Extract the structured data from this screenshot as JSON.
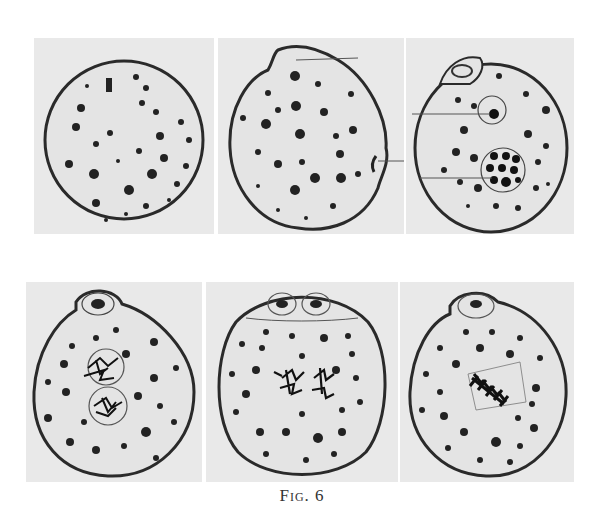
{
  "figure": {
    "caption": "Fig. 6",
    "rows": [
      {
        "panels": [
          {
            "id": "a",
            "description": "Round cell with scattered chromatin granules"
          },
          {
            "id": "b",
            "description": "Cell with protrusion and lateral indentation; two pointer lines"
          },
          {
            "id": "c",
            "description": "Cell with polar bud, nucleolus circle and granular vacuole; two pointer lines"
          }
        ]
      },
      {
        "panels": [
          {
            "id": "d",
            "description": "Cell with bud and two nuclei containing tangled chromatin"
          },
          {
            "id": "e",
            "description": "Cell with two polar bodies and paired chromatin masses"
          },
          {
            "id": "f",
            "description": "Cell with polar bud and metaphase chromosome plate"
          }
        ]
      }
    ]
  }
}
